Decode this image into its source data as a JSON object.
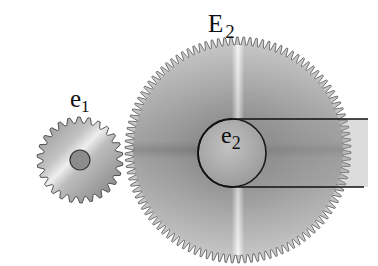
{
  "diagram": {
    "type": "gear-train",
    "labels": {
      "big_gear": {
        "main": "E",
        "sub": "2"
      },
      "small_gear": {
        "main": "e",
        "sub": "1"
      },
      "pulley": {
        "main": "e",
        "sub": "2"
      }
    },
    "gears": [
      {
        "id": "e1",
        "cx": 80,
        "cy": 160,
        "r_outer": 43,
        "r_root": 37,
        "teeth": 26,
        "hub_r": 10
      },
      {
        "id": "E2",
        "cx": 238,
        "cy": 150,
        "r_outer": 113,
        "r_root": 105,
        "teeth": 110
      }
    ],
    "pulley": {
      "cx": 232,
      "cy": 153,
      "r": 34
    },
    "belt": {
      "top_y": 119,
      "bottom_y": 187,
      "end_x_top": 368,
      "end_x_bottom": 364
    },
    "colors": {
      "gear_fill": "#a8a8a8",
      "highlight": "#f2f2f2",
      "outline": "#333333",
      "belt": "#111111"
    }
  }
}
